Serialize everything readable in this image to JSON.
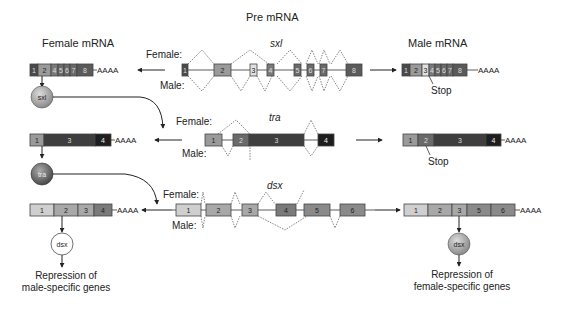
{
  "title": "Pre mRNA",
  "headings": {
    "female": "Female mRNA",
    "male": "Male mRNA"
  },
  "splice_labels": {
    "female": "Female:",
    "male": "Male:"
  },
  "polyA": "AAAA",
  "stop": "Stop",
  "genes": {
    "sxl": {
      "name": "sxl",
      "pre_exons": [
        "1",
        "2",
        "3",
        "4",
        "5",
        "6",
        "7",
        "8"
      ],
      "female_exons": [
        "1",
        "2",
        "4",
        "5",
        "6",
        "7",
        "8"
      ],
      "male_exons": [
        "1",
        "2",
        "3",
        "4",
        "5",
        "6",
        "7",
        "8"
      ],
      "female_protein": "sxl"
    },
    "tra": {
      "name": "tra",
      "pre_exons": [
        "1",
        "2",
        "3",
        "4"
      ],
      "female_exons": [
        "1",
        "3",
        "4"
      ],
      "male_exons": [
        "1",
        "2",
        "3",
        "4"
      ],
      "female_protein": "tra"
    },
    "dsx": {
      "name": "dsx",
      "pre_exons": [
        "1",
        "2",
        "3",
        "4",
        "5",
        "6"
      ],
      "female_exons": [
        "1",
        "2",
        "3",
        "4"
      ],
      "male_exons": [
        "1",
        "2",
        "3",
        "5",
        "6"
      ],
      "female_protein": "dsx",
      "male_protein": "dsx"
    }
  },
  "outcomes": {
    "female_line1": "Repression of",
    "female_line2": "male-specific genes",
    "male_line1": "Repression of",
    "male_line2": "female-specific genes"
  },
  "colors": {
    "exon_dark": "#4a4a4a",
    "exon_mid": "#7a7a7a",
    "exon_light": "#bdbdbd",
    "exon_black": "#222222",
    "protein_fill": "#9a9a9a",
    "background": "#ffffff"
  }
}
